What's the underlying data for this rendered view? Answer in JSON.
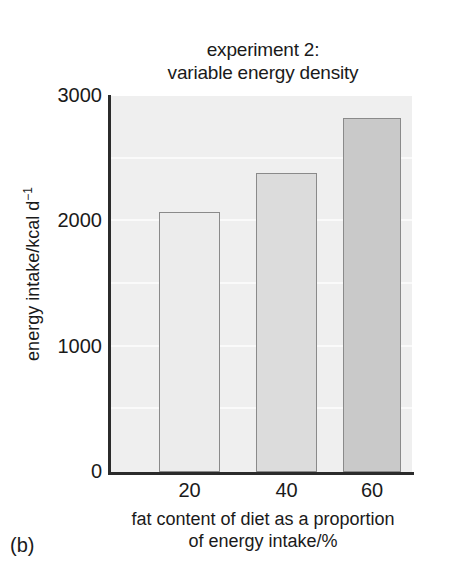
{
  "panel": {
    "label": "(b)"
  },
  "chart_data": {
    "type": "bar",
    "title": "experiment 2: variable energy density",
    "title_line1": "experiment 2:",
    "title_line2": "variable energy density",
    "categories": [
      "20",
      "40",
      "60"
    ],
    "values": [
      2075,
      2385,
      2825
    ],
    "xlabel": "fat content of diet as a proportion of energy intake/%",
    "xlabel_line1": "fat content of diet as a proportion",
    "xlabel_line2": "of energy intake/%",
    "ylabel": "energy intake/kcal d",
    "ylabel_exponent": "−1",
    "ylim": [
      0,
      3000
    ],
    "yticks": [
      "0",
      "1000",
      "2000",
      "3000"
    ],
    "ytick_values": [
      0,
      1000,
      2000,
      3000
    ],
    "minor_gridline_values": [
      500,
      1000,
      1500,
      2000,
      2500
    ],
    "grid": true,
    "legend": "none",
    "plot_background_color": "#efefef",
    "gridline_color": "#fafafa",
    "axis_color": "#2b2b2b",
    "bar_edge_color": "#8a8a8a",
    "bar_colors": [
      "#ececec",
      "#dcdcdc",
      "#c9c9c9"
    ]
  }
}
